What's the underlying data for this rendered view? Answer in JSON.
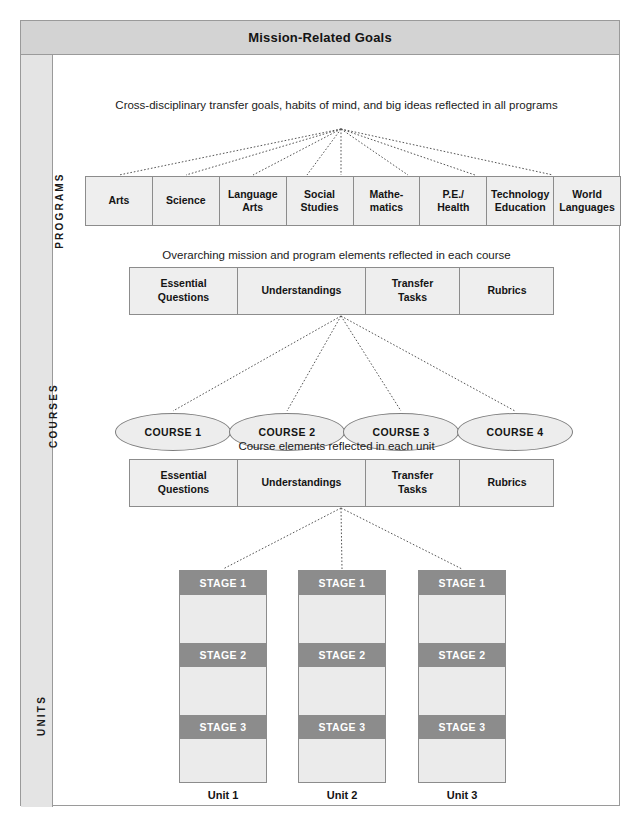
{
  "header": {
    "title": "Mission-Related Goals"
  },
  "rail": {
    "labels": [
      {
        "id": "programs",
        "text": "PROGRAMS"
      },
      {
        "id": "courses",
        "text": "COURSES"
      },
      {
        "id": "units",
        "text": "UNITS"
      }
    ]
  },
  "captions": {
    "programs": "Cross-disciplinary transfer goals, habits of mind, and big ideas reflected in all programs",
    "courses": "Overarching mission and program elements reflected in each course",
    "units": "Course elements reflected in each unit"
  },
  "programs": {
    "cells": [
      {
        "line1": "Arts",
        "line2": ""
      },
      {
        "line1": "Science",
        "line2": ""
      },
      {
        "line1": "Language",
        "line2": "Arts"
      },
      {
        "line1": "Social",
        "line2": "Studies"
      },
      {
        "line1": "Mathe-",
        "line2": "matics"
      },
      {
        "line1": "P.E./",
        "line2": "Health"
      },
      {
        "line1": "Technology",
        "line2": "Education"
      },
      {
        "line1": "World",
        "line2": "Languages"
      }
    ]
  },
  "course_elements": {
    "cells": [
      {
        "line1": "Essential",
        "line2": "Questions"
      },
      {
        "line1": "Understandings",
        "line2": ""
      },
      {
        "line1": "Transfer",
        "line2": "Tasks"
      },
      {
        "line1": "Rubrics",
        "line2": ""
      }
    ]
  },
  "unit_elements": {
    "cells": [
      {
        "line1": "Essential",
        "line2": "Questions"
      },
      {
        "line1": "Understandings",
        "line2": ""
      },
      {
        "line1": "Transfer",
        "line2": "Tasks"
      },
      {
        "line1": "Rubrics",
        "line2": ""
      }
    ]
  },
  "courses": {
    "ovals": [
      {
        "label": "COURSE 1"
      },
      {
        "label": "COURSE 2"
      },
      {
        "label": "COURSE 3"
      },
      {
        "label": "COURSE 4"
      }
    ]
  },
  "units": {
    "columns": [
      {
        "label": "Unit 1",
        "stages": [
          "STAGE 1",
          "STAGE 2",
          "STAGE 3"
        ]
      },
      {
        "label": "Unit 2",
        "stages": [
          "STAGE 1",
          "STAGE 2",
          "STAGE 3"
        ]
      },
      {
        "label": "Unit 3",
        "stages": [
          "STAGE 1",
          "STAGE 2",
          "STAGE 3"
        ]
      }
    ]
  },
  "colors": {
    "title_bar": "#d3d3d3",
    "rail": "#e4e4e4",
    "box_fill": "#eeeeee",
    "stage_bar": "#8c8c8c",
    "stage_text": "#ffffff",
    "border": "#8c8c8c",
    "connector": "#555555"
  }
}
